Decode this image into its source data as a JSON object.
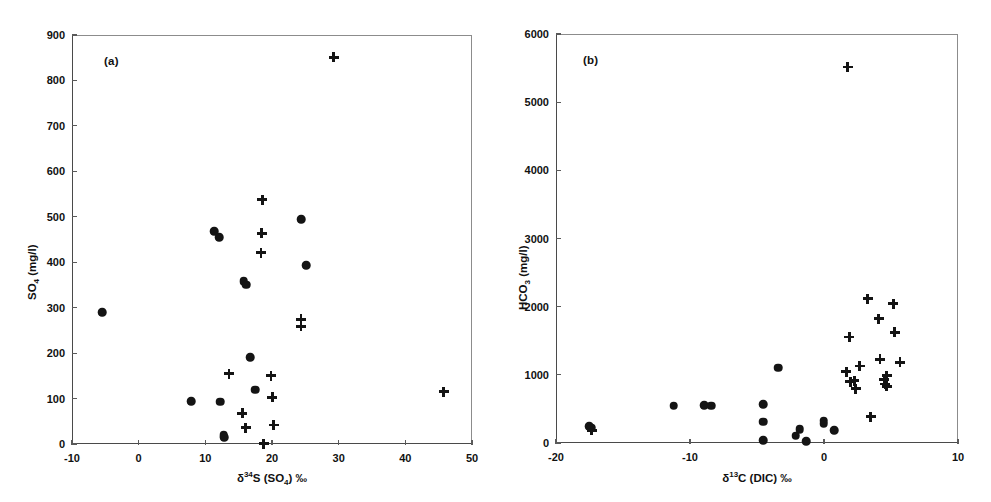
{
  "figure": {
    "background": "#ffffff",
    "marker_color": "#141414",
    "axis_color": "#4a4a4a"
  },
  "chart_data": [
    {
      "type": "scatter",
      "panel": "a",
      "panel_label": "(a)",
      "title": "",
      "xlabel": "δ³⁴S (SO₄) ‰",
      "xlabel_parts": {
        "delta": "δ",
        "sup": "34",
        "element": "S (SO",
        "sub": "4",
        "tail": ") ‰"
      },
      "ylabel": "SO₄ (mg/l)",
      "ylabel_parts": {
        "lead": "SO",
        "sub": "4",
        "tail": " (mg/l)"
      },
      "xlim": [
        -10,
        50
      ],
      "ylim": [
        0,
        900
      ],
      "xticks": [
        -10,
        0,
        10,
        20,
        30,
        40,
        50
      ],
      "yticks": [
        0,
        100,
        200,
        300,
        400,
        500,
        600,
        700,
        800,
        900
      ],
      "grid": false,
      "legend": "none",
      "series": [
        {
          "name": "circles",
          "marker": "circle",
          "points": [
            [
              -5.6,
              292
            ],
            [
              7.7,
              96
            ],
            [
              11.2,
              471
            ],
            [
              11.9,
              457
            ],
            [
              12.1,
              95
            ],
            [
              12.6,
              22
            ],
            [
              12.7,
              17
            ],
            [
              15.6,
              360
            ],
            [
              16.0,
              353
            ],
            [
              16.6,
              193
            ],
            [
              17.3,
              122
            ],
            [
              24.2,
              497
            ],
            [
              25.0,
              395
            ]
          ]
        },
        {
          "name": "crosses",
          "marker": "cross",
          "points": [
            [
              13.4,
              157
            ],
            [
              15.4,
              70
            ],
            [
              15.9,
              38
            ],
            [
              18.4,
              540
            ],
            [
              18.3,
              466
            ],
            [
              18.2,
              423
            ],
            [
              18.6,
              3
            ],
            [
              19.7,
              152
            ],
            [
              19.9,
              105
            ],
            [
              20.1,
              44
            ],
            [
              24.2,
              277
            ],
            [
              24.2,
              261
            ],
            [
              29.1,
              853
            ],
            [
              45.6,
              117
            ]
          ]
        }
      ]
    },
    {
      "type": "scatter",
      "panel": "b",
      "panel_label": "(b)",
      "title": "",
      "xlabel": "δ¹³C (DIC) ‰",
      "xlabel_parts": {
        "delta": "δ",
        "sup": "13",
        "element": "C (DIC) ‰"
      },
      "ylabel": "HCO₃ (mg/l)",
      "ylabel_parts": {
        "lead": "HCO",
        "sub": "3",
        "tail": " (mg/l)"
      },
      "xlim": [
        -20,
        10
      ],
      "ylim": [
        0,
        6000
      ],
      "xticks": [
        -20,
        -10,
        0,
        10
      ],
      "yticks": [
        0,
        1000,
        2000,
        3000,
        4000,
        5000,
        6000
      ],
      "grid": false,
      "legend": "none",
      "series": [
        {
          "name": "circles",
          "marker": "circle",
          "points": [
            [
              -17.6,
              265
            ],
            [
              -17.4,
              240
            ],
            [
              -11.3,
              560
            ],
            [
              -9.0,
              565
            ],
            [
              -8.5,
              563
            ],
            [
              -4.6,
              580
            ],
            [
              -4.6,
              330
            ],
            [
              -4.6,
              60
            ],
            [
              -3.5,
              1120
            ],
            [
              -2.2,
              120
            ],
            [
              -1.9,
              215
            ],
            [
              -1.4,
              40
            ],
            [
              -0.1,
              340
            ],
            [
              -0.1,
              300
            ],
            [
              0.7,
              200
            ]
          ]
        },
        {
          "name": "crosses",
          "marker": "cross",
          "points": [
            [
              -17.4,
              200
            ],
            [
              1.7,
              5530
            ],
            [
              1.8,
              1570
            ],
            [
              1.6,
              1060
            ],
            [
              1.9,
              915
            ],
            [
              2.3,
              810
            ],
            [
              2.6,
              1145
            ],
            [
              3.2,
              2130
            ],
            [
              3.4,
              400
            ],
            [
              4.0,
              1835
            ],
            [
              4.1,
              1245
            ],
            [
              4.4,
              940
            ],
            [
              4.5,
              880
            ],
            [
              4.6,
              1000
            ],
            [
              4.6,
              845
            ],
            [
              5.1,
              2055
            ],
            [
              5.2,
              1640
            ],
            [
              5.6,
              1200
            ],
            [
              2.2,
              930
            ]
          ]
        }
      ]
    }
  ]
}
